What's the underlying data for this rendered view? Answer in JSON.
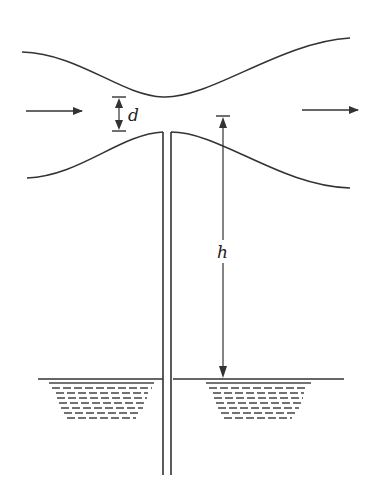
{
  "diagram": {
    "type": "venturi-aspirator",
    "labels": {
      "throat_gap": "d",
      "height": "h"
    },
    "colors": {
      "stroke": "#333333",
      "background": "#ffffff"
    },
    "flow_arrows": [
      "inlet-arrow",
      "outlet-arrow"
    ]
  }
}
